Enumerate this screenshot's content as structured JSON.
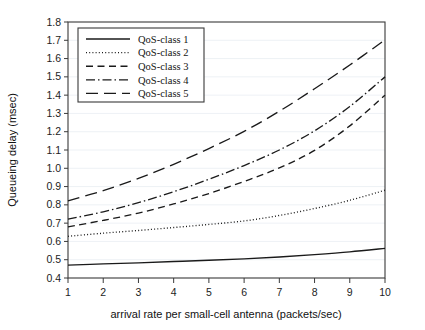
{
  "chart_data": {
    "type": "line",
    "title": "",
    "xlabel": "arrival rate per small-cell antenna (packets/sec)",
    "ylabel": "Queueing delay (msec)",
    "xlim": [
      1,
      10
    ],
    "ylim": [
      0.4,
      1.8
    ],
    "grid": true,
    "legend_position": "top-left inside plot",
    "x": [
      1,
      2,
      3,
      4,
      5,
      6,
      7,
      8,
      9,
      10
    ],
    "xticks": [
      "1",
      "2",
      "3",
      "4",
      "5",
      "6",
      "7",
      "8",
      "9",
      "10"
    ],
    "yticks": [
      "0.4",
      "0.5",
      "0.6",
      "0.7",
      "0.8",
      "0.9",
      "1.0",
      "1.1",
      "1.2",
      "1.3",
      "1.4",
      "1.5",
      "1.6",
      "1.7",
      "1.8"
    ],
    "series": [
      {
        "name": "QoS-class 1",
        "style": "solid",
        "dash": "none",
        "color": "#1a1a1a",
        "values": [
          0.47,
          0.477,
          0.483,
          0.49,
          0.497,
          0.505,
          0.515,
          0.528,
          0.543,
          0.562
        ]
      },
      {
        "name": "QoS-class 2",
        "style": "dotted",
        "dash": "1,2.2",
        "color": "#1a1a1a",
        "values": [
          0.628,
          0.645,
          0.66,
          0.676,
          0.693,
          0.712,
          0.742,
          0.78,
          0.825,
          0.88
        ]
      },
      {
        "name": "QoS-class 3",
        "style": "dashed",
        "dash": "7,4.5",
        "color": "#1a1a1a",
        "values": [
          0.68,
          0.715,
          0.755,
          0.805,
          0.862,
          0.928,
          1.002,
          1.098,
          1.232,
          1.4
        ]
      },
      {
        "name": "QoS-class 4",
        "style": "dash-dot",
        "dash": "9,3,1.5,3",
        "color": "#1a1a1a",
        "values": [
          0.722,
          0.762,
          0.812,
          0.872,
          0.94,
          1.015,
          1.1,
          1.205,
          1.338,
          1.5
        ]
      },
      {
        "name": "QoS-class 5",
        "style": "long-dash",
        "dash": "12,6",
        "color": "#1a1a1a",
        "values": [
          0.822,
          0.878,
          0.945,
          1.022,
          1.108,
          1.202,
          1.312,
          1.435,
          1.565,
          1.702
        ]
      }
    ]
  },
  "legend": {
    "entries": [
      "QoS-class 1",
      "QoS-class 2",
      "QoS-class 3",
      "QoS-class 4",
      "QoS-class 5"
    ]
  },
  "axes": {
    "x_title": "arrival rate per small-cell antenna (packets/sec)",
    "y_title": "Queueing delay (msec)"
  }
}
